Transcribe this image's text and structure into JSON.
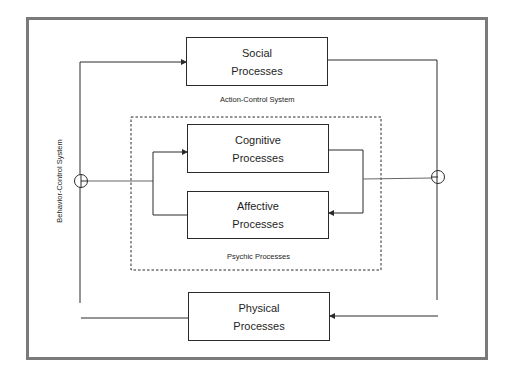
{
  "diagram": {
    "boxes": {
      "social": {
        "line1": "Social",
        "line2": "Processes"
      },
      "cognitive": {
        "line1": "Cognitive",
        "line2": "Processes"
      },
      "affective": {
        "line1": "Affective",
        "line2": "Processes"
      },
      "physical": {
        "line1": "Physical",
        "line2": "Processes"
      }
    },
    "labels": {
      "action_control": "Action-Control System",
      "psychic": "Psychic Processes",
      "behavior_control": "Behavior-Control System"
    },
    "colors": {
      "frame": "#7a7a7a",
      "lines": "#2a2a2a"
    }
  }
}
